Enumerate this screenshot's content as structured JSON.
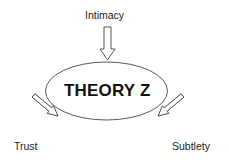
{
  "diagram": {
    "center_label": "THEORY Z",
    "inputs": [
      {
        "label": "Intimacy",
        "position": "top"
      },
      {
        "label": "Trust",
        "position": "bottom-left"
      },
      {
        "label": "Subtlety",
        "position": "bottom-right"
      }
    ],
    "colors": {
      "stroke": "#333333",
      "text": "#111111",
      "background": "#ffffff"
    }
  }
}
